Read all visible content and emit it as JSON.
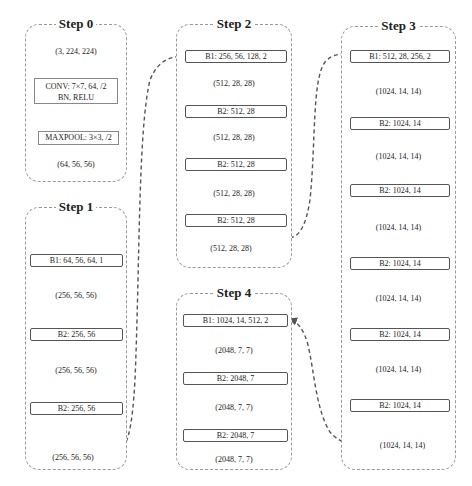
{
  "colors": {
    "stage_border": "#999999",
    "block_border": "#555555",
    "arrow": "#555555",
    "text": "#222222"
  },
  "stages": {
    "step0": {
      "title": "Step 0",
      "input_shape": "(3, 224, 224)",
      "conv_line1": "CONV: 7×7, 64, /2",
      "conv_line2": "BN, RELU",
      "maxpool": "MAXPOOL: 3×3, /2",
      "output_shape": "(64, 56, 56)"
    },
    "step1": {
      "title": "Step 1",
      "blocks": [
        "B1: 64, 56, 64, 1",
        "B2: 256, 56",
        "B2: 256, 56"
      ],
      "shapes": [
        "(256, 56, 56)",
        "(256, 56, 56)",
        "(256, 56, 56)"
      ]
    },
    "step2": {
      "title": "Step 2",
      "blocks": [
        "B1: 256, 56, 128, 2",
        "B2: 512, 28",
        "B2: 512, 28",
        "B2: 512, 28"
      ],
      "shapes": [
        "(512, 28, 28)",
        "(512, 28, 28)",
        "(512, 28, 28)",
        "(512, 28, 28)"
      ]
    },
    "step3": {
      "title": "Step 3",
      "blocks": [
        "B1: 512, 28, 256, 2",
        "B2: 1024, 14",
        "B2: 1024, 14",
        "B2: 1024, 14",
        "B2: 1024, 14",
        "B2: 1024, 14"
      ],
      "shapes": [
        "(1024, 14, 14)",
        "(1024, 14, 14)",
        "(1024, 14, 14)",
        "(1024, 14, 14)",
        "(1024, 14, 14)",
        "(1024, 14, 14)"
      ]
    },
    "step4": {
      "title": "Step 4",
      "blocks": [
        "B1: 1024, 14, 512, 2",
        "B2: 2048, 7",
        "B2: 2048, 7"
      ],
      "shapes": [
        "(2048, 7, 7)",
        "(2048, 7, 7)",
        "(2048, 7, 7)"
      ]
    }
  },
  "connections": [
    {
      "from": "step1.output",
      "to": "step2.B1"
    },
    {
      "from": "step2.output",
      "to": "step3.B1"
    },
    {
      "from": "step3.output",
      "to": "step4.B1"
    }
  ]
}
